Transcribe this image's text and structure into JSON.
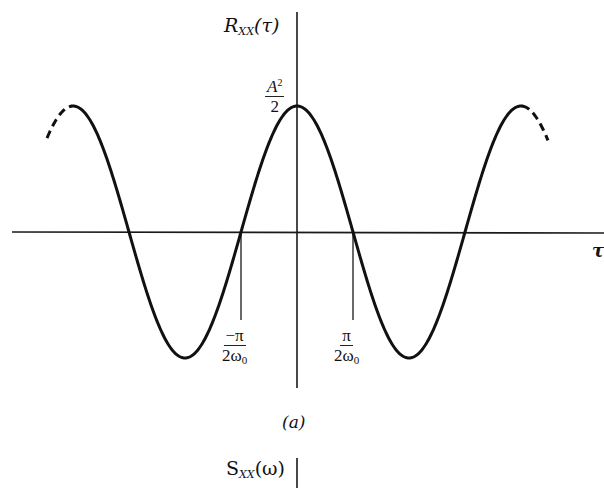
{
  "figure": {
    "caption": "(a)",
    "top_plot": {
      "y_axis_label": {
        "symbol": "R",
        "subscript": "XX",
        "arg": "(τ)"
      },
      "x_axis_label": "τ",
      "peak_label": {
        "numerator": "A",
        "numerator_sup": "2",
        "denominator": "2"
      },
      "tick_neg": {
        "numerator": "−π",
        "denominator": "2ω",
        "den_sub": "0"
      },
      "tick_pos": {
        "numerator": "π",
        "denominator": "2ω",
        "den_sub": "0"
      },
      "curve": "cosine",
      "ends": "dashed continuation on both sides"
    },
    "bottom_plot": {
      "y_axis_label": {
        "symbol": "S",
        "subscript": "XX",
        "arg": "(ω)"
      }
    }
  },
  "colors": {
    "ink": "#111111",
    "background": "#ffffff"
  }
}
